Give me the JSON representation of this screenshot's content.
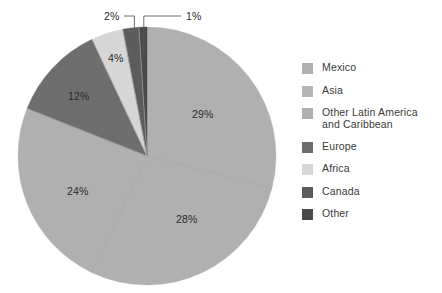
{
  "chart_data": {
    "type": "pie",
    "title": "",
    "subtitle": "",
    "xlabel": "",
    "ylabel": "",
    "grid": false,
    "legend_position": "right",
    "start_angle_deg": 0,
    "direction": "clockwise",
    "categories": [
      "Mexico",
      "Asia",
      "Other Latin America and Caribbean",
      "Europe",
      "Africa",
      "Canada",
      "Other"
    ],
    "values": [
      29,
      28,
      24,
      12,
      4,
      2,
      1
    ],
    "data_labels": [
      "29%",
      "28%",
      "24%",
      "12%",
      "4%",
      "2%",
      "1%"
    ],
    "colors": [
      "#b0b0b0",
      "#b0b0b0",
      "#b0b0b0",
      "#6e6e6e",
      "#d6d6d6",
      "#5c5c5c",
      "#4a4a4a"
    ],
    "annotations": [
      {
        "text": "2%",
        "points_to": "Canada"
      },
      {
        "text": "1%",
        "points_to": "Other"
      }
    ]
  },
  "pie": {
    "center_x": 147,
    "center_y": 156,
    "radius": 129,
    "slices": [
      {
        "name": "Mexico",
        "label": "29%",
        "color": "#b0b0b0",
        "value": 29,
        "label_x": 192,
        "label_y": 109
      },
      {
        "name": "Asia",
        "label": "28%",
        "color": "#b0b0b0",
        "value": 28,
        "label_x": 176,
        "label_y": 214
      },
      {
        "name": "Other Latin America and Caribbean",
        "label": "24%",
        "color": "#b0b0b0",
        "value": 24,
        "label_x": 67,
        "label_y": 186
      },
      {
        "name": "Europe",
        "label": "12%",
        "color": "#6e6e6e",
        "value": 12,
        "label_x": 68,
        "label_y": 91
      },
      {
        "name": "Africa",
        "label": "4%",
        "color": "#d6d6d6",
        "value": 4,
        "label_x": 108,
        "label_y": 53
      },
      {
        "name": "Canada",
        "label": "2%",
        "color": "#5c5c5c",
        "value": 2,
        "label_x": 104,
        "label_y": 11
      },
      {
        "name": "Other",
        "label": "1%",
        "color": "#4a4a4a",
        "value": 1,
        "label_x": 186,
        "label_y": 11
      }
    ]
  },
  "legend": {
    "items": [
      {
        "label": "Mexico",
        "label_line2": "",
        "color": "#b0b0b0"
      },
      {
        "label": "Asia",
        "label_line2": "",
        "color": "#b5b5b5"
      },
      {
        "label": "Other Latin America",
        "label_line2": "and Caribbean",
        "color": "#b0b0b0"
      },
      {
        "label": "Europe",
        "label_line2": "",
        "color": "#6e6e6e"
      },
      {
        "label": "Africa",
        "label_line2": "",
        "color": "#d6d6d6"
      },
      {
        "label": "Canada",
        "label_line2": "",
        "color": "#5c5c5c"
      },
      {
        "label": "Other",
        "label_line2": "",
        "color": "#4a4a4a"
      }
    ]
  }
}
